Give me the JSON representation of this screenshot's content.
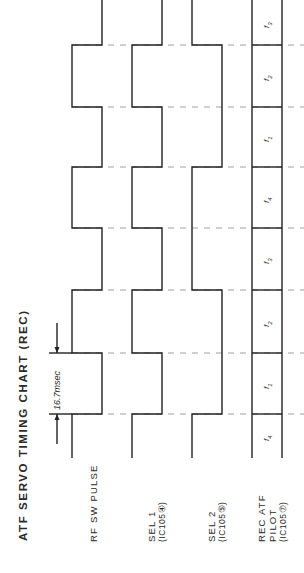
{
  "title": "ATF SERVO TIMING CHART (REC)",
  "dimension": {
    "label": "16.7msec",
    "from_y": 353,
    "to_y": 414
  },
  "signals": [
    {
      "name": "RF SW PULSE",
      "pin": ""
    },
    {
      "name": "SEL 1",
      "pin": "(IC105④)"
    },
    {
      "name": "SEL 2",
      "pin": "(IC105⑤)"
    },
    {
      "name": "REC ATF PILOT",
      "line1": "REC ATF",
      "line2": "PILOT",
      "pin": "(IC105⑦)"
    }
  ],
  "bands": [
    {
      "label": "f4",
      "sub": "4",
      "y0": 414,
      "y1": 458
    },
    {
      "label": "f1",
      "sub": "1",
      "y0": 353,
      "y1": 414
    },
    {
      "label": "f2",
      "sub": "2",
      "y0": 290,
      "y1": 353
    },
    {
      "label": "f3",
      "sub": "3",
      "y0": 228,
      "y1": 290
    },
    {
      "label": "f4",
      "sub": "4",
      "y0": 167,
      "y1": 228
    },
    {
      "label": "f1",
      "sub": "1",
      "y0": 107,
      "y1": 167
    },
    {
      "label": "f2",
      "sub": "2",
      "y0": 45,
      "y1": 107
    },
    {
      "label": "f3",
      "sub": "3",
      "y0": 0,
      "y1": 45
    }
  ],
  "chart_data": {
    "type": "timing",
    "title": "ATF SERVO TIMING CHART (REC)",
    "time_unit": "field",
    "field_period": "16.7msec",
    "fields": [
      "F1",
      "F2",
      "F3",
      "F4",
      "F5",
      "F6",
      "F7",
      "F8"
    ],
    "series": [
      {
        "name": "RF SW PULSE",
        "values": [
          1,
          0,
          1,
          0,
          1,
          0,
          1,
          0
        ]
      },
      {
        "name": "SEL 1 (IC105④)",
        "values": [
          1,
          0,
          1,
          0,
          1,
          0,
          1,
          0
        ]
      },
      {
        "name": "SEL 2 (IC105⑤)",
        "values": [
          1,
          0,
          0,
          1,
          1,
          0,
          0,
          1
        ]
      },
      {
        "name": "REC ATF PILOT (IC105⑦)",
        "values": [
          "f4",
          "f1",
          "f2",
          "f3",
          "f4",
          "f1",
          "f2",
          "f3"
        ]
      }
    ],
    "annotations": [
      "16.7msec"
    ]
  }
}
